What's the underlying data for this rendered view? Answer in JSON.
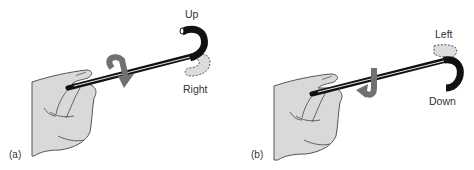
{
  "figure": {
    "panels": [
      {
        "id": "a",
        "label": "(a)",
        "solid_direction": "Up",
        "dashed_direction": "Right",
        "rotation": "clockwise"
      },
      {
        "id": "b",
        "label": "(b)",
        "solid_direction": "Down",
        "dashed_direction": "Left",
        "rotation": "counterclockwise"
      }
    ]
  },
  "colors": {
    "shaft": "#111111",
    "hand_fill": "#d9d9d9",
    "hand_stroke": "#555555",
    "arrow": "#707070",
    "ghost_fill": "#dcdcdc",
    "ghost_stroke": "#555555",
    "text": "#333333"
  }
}
